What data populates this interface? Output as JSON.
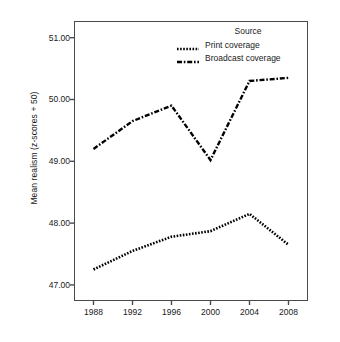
{
  "chart_data": {
    "type": "line",
    "title": "",
    "xlabel": "",
    "ylabel": "Mean realism (z-scores + 50)",
    "x": [
      1988,
      1992,
      1996,
      2000,
      2004,
      2008
    ],
    "xtick_labels": [
      "1988",
      "1992",
      "1996",
      "2000",
      "2004",
      "2008"
    ],
    "ytick_labels": [
      "51.00",
      "50.00",
      "49.00",
      "48.00",
      "47.00"
    ],
    "ytick_values": [
      51.0,
      50.0,
      49.0,
      48.0,
      47.0
    ],
    "xlim": [
      1986,
      2010
    ],
    "ylim": [
      46.74,
      51.27
    ],
    "grid": false,
    "legend_position": "top-right",
    "legend_title": "Source",
    "series": [
      {
        "name": "Print coverage",
        "linestyle": "dotted",
        "color": "#000000",
        "values": [
          47.25,
          47.55,
          47.78,
          47.87,
          48.15,
          47.65
        ]
      },
      {
        "name": "Broadcast coverage",
        "linestyle": "dash-dot",
        "color": "#000000",
        "values": [
          49.2,
          49.65,
          49.9,
          49.02,
          50.3,
          50.35
        ]
      }
    ]
  },
  "axis": {
    "frame_color": "#4a4a4a"
  }
}
